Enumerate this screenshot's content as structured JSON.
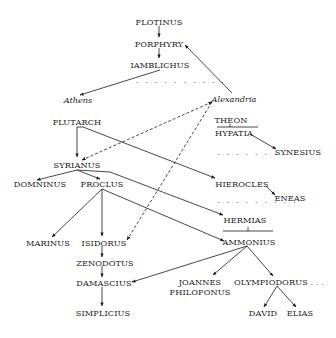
{
  "diagram": {
    "type": "lineage",
    "colors": {
      "ink": "#1a1a1a",
      "background": "#ffffff"
    },
    "nodes": {
      "plotinus": "PLOTINUS",
      "porphyry": "PORPHYRY",
      "iamblichus": "IAMBLICHUS",
      "athens": "Athens",
      "alexandria": "Alexandria",
      "plutarch": "PLUTARCH",
      "theon": "THEON",
      "hypatia": "HYPATIA",
      "synesius": "SYNESIUS",
      "syrianus": "SYRIANUS",
      "domninus": "DOMNINUS",
      "proclus": "PROCLUS",
      "hierocles": "HIEROCLES",
      "eneas": "ENEAS",
      "hermias": "HERMIAS",
      "marinus": "MARINUS",
      "isidorus": "ISIDORUS",
      "ammonius": "AMMONIUS",
      "zenodotus": "ZENODOTUS",
      "damascius": "DAMASCIUS",
      "joannes": "JOANNES",
      "philoponus": "PHILOPONUS",
      "olympiodorus": "OLYMPIODORUS . . .",
      "simplicius": "SIMPLICIUS",
      "david": "DAVID",
      "elias": "ELIAS"
    },
    "ellipses": {
      "after_iamblichus": ". . . . . . . . . .",
      "before_synesius": ". . . . . . . .",
      "before_eneas": ". . . . . . . . ."
    },
    "edges": [
      {
        "from": "PLOTINUS",
        "to": "PORPHYRY",
        "style": "solid"
      },
      {
        "from": "PORPHYRY",
        "to": "IAMBLICHUS",
        "style": "solid"
      },
      {
        "from": "IAMBLICHUS",
        "to": "Athens",
        "style": "solid"
      },
      {
        "from": "Alexandria",
        "to": "PORPHYRY",
        "style": "solid"
      },
      {
        "from": "PLUTARCH",
        "to": "SYRIANUS",
        "style": "solid"
      },
      {
        "from": "PLUTARCH",
        "to": "HIEROCLES",
        "style": "solid"
      },
      {
        "from": "Alexandria",
        "to": "SYRIANUS",
        "style": "dashed"
      },
      {
        "from": "Alexandria",
        "to": "ISIDORUS",
        "style": "dashed"
      },
      {
        "from": "HYPATIA",
        "to": "SYNESIUS",
        "style": "solid"
      },
      {
        "from": "SYRIANUS",
        "to": "DOMNINUS",
        "style": "solid"
      },
      {
        "from": "SYRIANUS",
        "to": "PROCLUS",
        "style": "solid"
      },
      {
        "from": "SYRIANUS",
        "to": "HERMIAS",
        "style": "solid"
      },
      {
        "from": "HIEROCLES",
        "to": "ENEAS",
        "style": "solid"
      },
      {
        "from": "PROCLUS",
        "to": "MARINUS",
        "style": "solid"
      },
      {
        "from": "PROCLUS",
        "to": "ISIDORUS",
        "style": "solid"
      },
      {
        "from": "PROCLUS",
        "to": "AMMONIUS",
        "style": "solid"
      },
      {
        "from": "HERMIAS",
        "to": "AMMONIUS",
        "style": "marriage/descent"
      },
      {
        "from": "THEON",
        "to": "HYPATIA",
        "style": "marriage/descent"
      },
      {
        "from": "ISIDORUS",
        "to": "ZENODOTUS",
        "style": "solid"
      },
      {
        "from": "ZENODOTUS",
        "to": "DAMASCIUS",
        "style": "solid"
      },
      {
        "from": "DAMASCIUS",
        "to": "SIMPLICIUS",
        "style": "solid"
      },
      {
        "from": "AMMONIUS",
        "to": "DAMASCIUS",
        "style": "solid"
      },
      {
        "from": "AMMONIUS",
        "to": "JOANNES PHILOPONUS",
        "style": "solid"
      },
      {
        "from": "AMMONIUS",
        "to": "OLYMPIODORUS",
        "style": "solid"
      },
      {
        "from": "OLYMPIODORUS",
        "to": "DAVID",
        "style": "solid"
      },
      {
        "from": "OLYMPIODORUS",
        "to": "ELIAS",
        "style": "solid"
      }
    ]
  }
}
